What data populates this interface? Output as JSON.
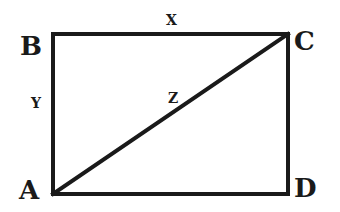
{
  "diagram": {
    "type": "rectangle-with-diagonal",
    "vertices": [
      {
        "id": "A",
        "label": "A",
        "position": "bottom-left"
      },
      {
        "id": "B",
        "label": "B",
        "position": "top-left"
      },
      {
        "id": "C",
        "label": "C",
        "position": "top-right"
      },
      {
        "id": "D",
        "label": "D",
        "position": "bottom-right"
      }
    ],
    "edges": [
      {
        "from": "B",
        "to": "C",
        "label": "X",
        "role": "width"
      },
      {
        "from": "A",
        "to": "B",
        "label": "Y",
        "role": "height"
      },
      {
        "from": "A",
        "to": "C",
        "label": "Z",
        "role": "diagonal"
      },
      {
        "from": "C",
        "to": "D",
        "label": ""
      },
      {
        "from": "A",
        "to": "D",
        "label": ""
      }
    ],
    "stroke_color": "#1a1a1a",
    "background_color": "#ffffff"
  }
}
